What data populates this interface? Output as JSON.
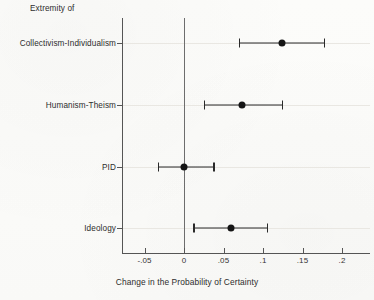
{
  "figure": {
    "background_color": "#fdfdfb",
    "ink_color": "#2a2a2a",
    "grid_color": "#e9e7e2"
  },
  "axes": {
    "y_group_header": "Extremity of",
    "x_title": "Change in the Probability of Certainty",
    "x_ticklabels": [
      "-.05",
      "0",
      ".05",
      ".1",
      ".15",
      ".2"
    ],
    "x_tickvalues": [
      -0.05,
      0,
      0.05,
      0.1,
      0.15,
      0.2
    ],
    "xlim": [
      -0.073,
      0.24
    ],
    "zero_reference_label": "0"
  },
  "chart_data": {
    "type": "scatter",
    "subtype": "dot-and-whisker",
    "orientation": "horizontal",
    "title": "",
    "xlabel": "Change in the Probability of Certainty",
    "ylabel": "Extremity of",
    "xlim": [
      -0.073,
      0.24
    ],
    "grid": true,
    "legend": "none",
    "zero_line": 0,
    "categories": [
      "Collectivism-Individualism",
      "Humanism-Theism",
      "PID",
      "Ideology"
    ],
    "values": [
      0.124,
      0.074,
      0.0,
      0.059
    ],
    "ci_low": [
      0.069,
      0.025,
      -0.033,
      0.012
    ],
    "ci_high": [
      0.177,
      0.124,
      0.037,
      0.105
    ],
    "points": [
      {
        "category": "Collectivism-Individualism",
        "estimate": 0.124,
        "ci_low": 0.069,
        "ci_high": 0.177,
        "significant": true
      },
      {
        "category": "Humanism-Theism",
        "estimate": 0.074,
        "ci_low": 0.025,
        "ci_high": 0.124,
        "significant": true
      },
      {
        "category": "PID",
        "estimate": 0.0,
        "ci_low": -0.033,
        "ci_high": 0.037,
        "significant": false
      },
      {
        "category": "Ideology",
        "estimate": 0.059,
        "ci_low": 0.012,
        "ci_high": 0.105,
        "significant": true
      }
    ]
  }
}
